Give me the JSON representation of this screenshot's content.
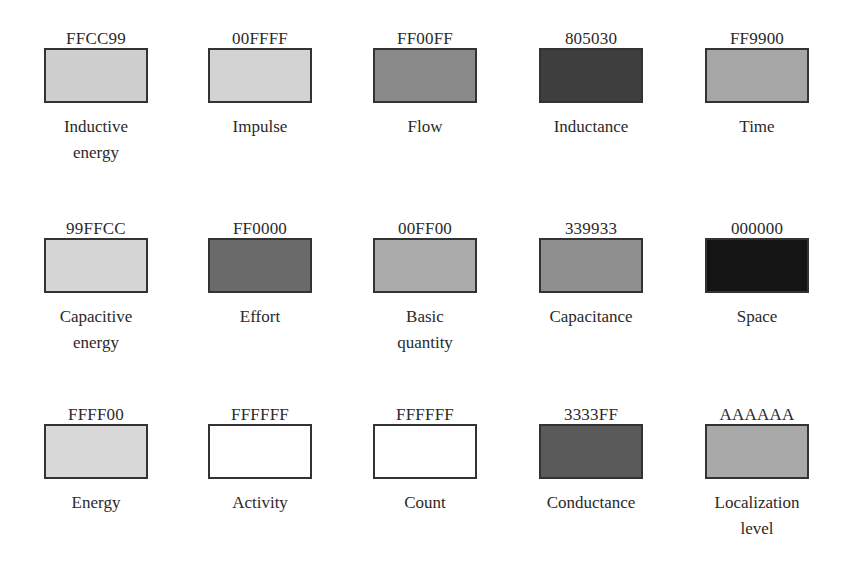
{
  "legend": {
    "rows": [
      {
        "items": [
          {
            "hex": "FFCC99",
            "label": "Inductive\nenergy",
            "gray": "#cfcfcf"
          },
          {
            "hex": "00FFFF",
            "label": "Impulse",
            "gray": "#d3d3d3"
          },
          {
            "hex": "FF00FF",
            "label": "Flow",
            "gray": "#8a8a8a"
          },
          {
            "hex": "805030",
            "label": "Inductance",
            "gray": "#3e3e3e"
          },
          {
            "hex": "FF9900",
            "label": "Time",
            "gray": "#a6a6a6"
          }
        ]
      },
      {
        "items": [
          {
            "hex": "99FFCC",
            "label": "Capacitive\nenergy",
            "gray": "#d6d6d6"
          },
          {
            "hex": "FF0000",
            "label": "Effort",
            "gray": "#6a6a6a"
          },
          {
            "hex": "00FF00",
            "label": "Basic\nquantity",
            "gray": "#ababab"
          },
          {
            "hex": "339933",
            "label": "Capacitance",
            "gray": "#8f8f8f"
          },
          {
            "hex": "000000",
            "label": "Space",
            "gray": "#141414"
          }
        ]
      },
      {
        "items": [
          {
            "hex": "FFFF00",
            "label": "Energy",
            "gray": "#d8d8d8"
          },
          {
            "hex": "FFFFFF",
            "label": "Activity",
            "gray": "#ffffff"
          },
          {
            "hex": "FFFFFF",
            "label": "Count",
            "gray": "#ffffff"
          },
          {
            "hex": "3333FF",
            "label": "Conductance",
            "gray": "#5a5a5a"
          },
          {
            "hex": "AAAAAA",
            "label": "Localization\nlevel",
            "gray": "#a9a9a9"
          }
        ]
      }
    ]
  }
}
